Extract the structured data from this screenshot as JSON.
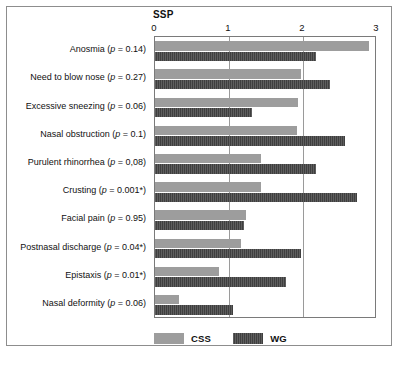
{
  "figure": {
    "title": "SSP",
    "frame_color": "#8d8d8d"
  },
  "legend": {
    "position": "bottom-left",
    "items": [
      {
        "name": "css",
        "label": "CSS",
        "color": "#9d9d9d"
      },
      {
        "name": "wg",
        "label": "WG",
        "color": "#3f3f3f"
      }
    ]
  },
  "chart_data": {
    "type": "bar",
    "orientation": "horizontal",
    "title": "SSP",
    "xlabel": "SSP",
    "ylabel": "",
    "xlim": [
      0,
      3
    ],
    "xticks": [
      0,
      1,
      2,
      3
    ],
    "xtick_labels": [
      "0",
      "1",
      "2",
      "3"
    ],
    "grid": true,
    "grid_axis": "x",
    "legend_position": "bottom-left",
    "categories": [
      "Anosmia (p = 0.14)",
      "Need to blow nose (p = 0.27)",
      "Excessive sneezing (p = 0.06)",
      "Nasal obstruction (p = 0.1)",
      "Purulent rhinorrhea (p = 0,08)",
      "Crusting (p = 0.001*)",
      "Facial pain (p = 0.95)",
      "Postnasal discharge (p = 0.04*)",
      "Epistaxis (p = 0.01*)",
      "Nasal deformity (p = 0.06)"
    ],
    "category_parts": [
      {
        "name": "Anosmia",
        "p": "0.14",
        "starred": false
      },
      {
        "name": "Need to blow nose",
        "p": "0.27",
        "starred": false
      },
      {
        "name": "Excessive sneezing",
        "p": "0.06",
        "starred": false
      },
      {
        "name": "Nasal obstruction",
        "p": "0.1",
        "starred": false
      },
      {
        "name": "Purulent rhinorrhea",
        "p": "0,08",
        "starred": false
      },
      {
        "name": "Crusting",
        "p": "0.001*",
        "starred": true
      },
      {
        "name": "Facial pain",
        "p": "0.95",
        "starred": false
      },
      {
        "name": "Postnasal discharge",
        "p": "0.04*",
        "starred": true
      },
      {
        "name": "Epistaxis",
        "p": "0.01*",
        "starred": true
      },
      {
        "name": "Nasal deformity",
        "p": "0.06",
        "starred": false
      }
    ],
    "series": [
      {
        "name": "CSS",
        "color": "#9d9d9d",
        "values": [
          2.89,
          1.97,
          1.93,
          1.92,
          1.43,
          1.43,
          1.23,
          1.16,
          0.86,
          0.33
        ]
      },
      {
        "name": "WG",
        "color": "#3f3f3f",
        "values": [
          2.18,
          2.36,
          1.31,
          2.57,
          2.18,
          2.73,
          1.2,
          1.97,
          1.77,
          1.06
        ]
      }
    ]
  }
}
